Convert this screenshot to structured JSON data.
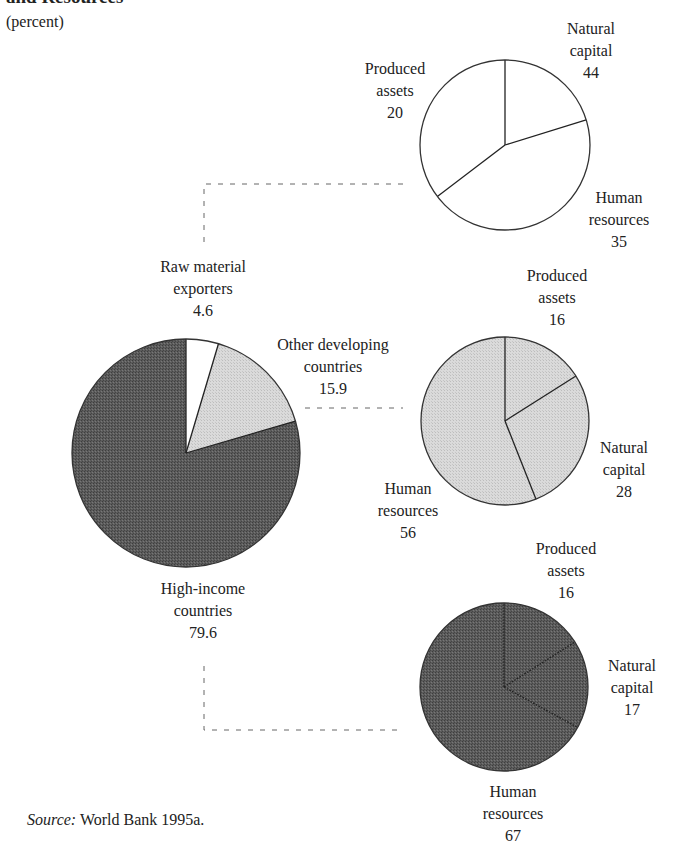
{
  "figure": {
    "title": "and Resources",
    "subtitle": "(percent)",
    "source_label": "Source:",
    "source_text": "World Bank 1995a."
  },
  "colors": {
    "dark_fill": "#5c5c5c",
    "light_fill": "#d9d9d9",
    "white_fill": "#ffffff",
    "stroke": "#333333"
  },
  "main_pie": {
    "slices": [
      {
        "name": "Raw material exporters",
        "line1": "Raw material",
        "line2": "exporters",
        "value": 4.6,
        "fill": "white"
      },
      {
        "name": "Other developing countries",
        "line1": "Other developing",
        "line2": "countries",
        "value": 15.9,
        "fill": "light"
      },
      {
        "name": "High-income countries",
        "line1": "High-income",
        "line2": "countries",
        "value": 79.6,
        "fill": "dark"
      }
    ]
  },
  "sub_pies": [
    {
      "group": "Raw material exporters",
      "fill": "white",
      "labels": {
        "produced": {
          "line1": "Produced",
          "line2": "assets",
          "value": "20"
        },
        "natural": {
          "line1": "Natural",
          "line2": "capital",
          "value": "44"
        },
        "human": {
          "line1": "Human",
          "line2": "resources",
          "value": "35"
        }
      }
    },
    {
      "group": "Other developing countries",
      "fill": "light",
      "labels": {
        "produced": {
          "line1": "Produced",
          "line2": "assets",
          "value": "16"
        },
        "natural": {
          "line1": "Natural",
          "line2": "capital",
          "value": "28"
        },
        "human": {
          "line1": "Human",
          "line2": "resources",
          "value": "56"
        }
      }
    },
    {
      "group": "High-income countries",
      "fill": "dark",
      "labels": {
        "produced": {
          "line1": "Produced",
          "line2": "assets",
          "value": "16"
        },
        "natural": {
          "line1": "Natural",
          "line2": "capital",
          "value": "17"
        },
        "human": {
          "line1": "Human",
          "line2": "resources",
          "value": "67"
        }
      }
    }
  ],
  "chart_data": [
    {
      "type": "pie",
      "title": "World wealth by country group (percent)",
      "categories": [
        "Raw material exporters",
        "Other developing countries",
        "High-income countries"
      ],
      "values": [
        4.6,
        15.9,
        79.6
      ]
    },
    {
      "type": "pie",
      "title": "Raw material exporters",
      "categories": [
        "Produced assets",
        "Natural capital",
        "Human resources"
      ],
      "values": [
        20,
        44,
        35
      ]
    },
    {
      "type": "pie",
      "title": "Other developing countries",
      "categories": [
        "Produced assets",
        "Natural capital",
        "Human resources"
      ],
      "values": [
        16,
        28,
        56
      ]
    },
    {
      "type": "pie",
      "title": "High-income countries",
      "categories": [
        "Produced assets",
        "Natural capital",
        "Human resources"
      ],
      "values": [
        16,
        17,
        67
      ]
    }
  ]
}
